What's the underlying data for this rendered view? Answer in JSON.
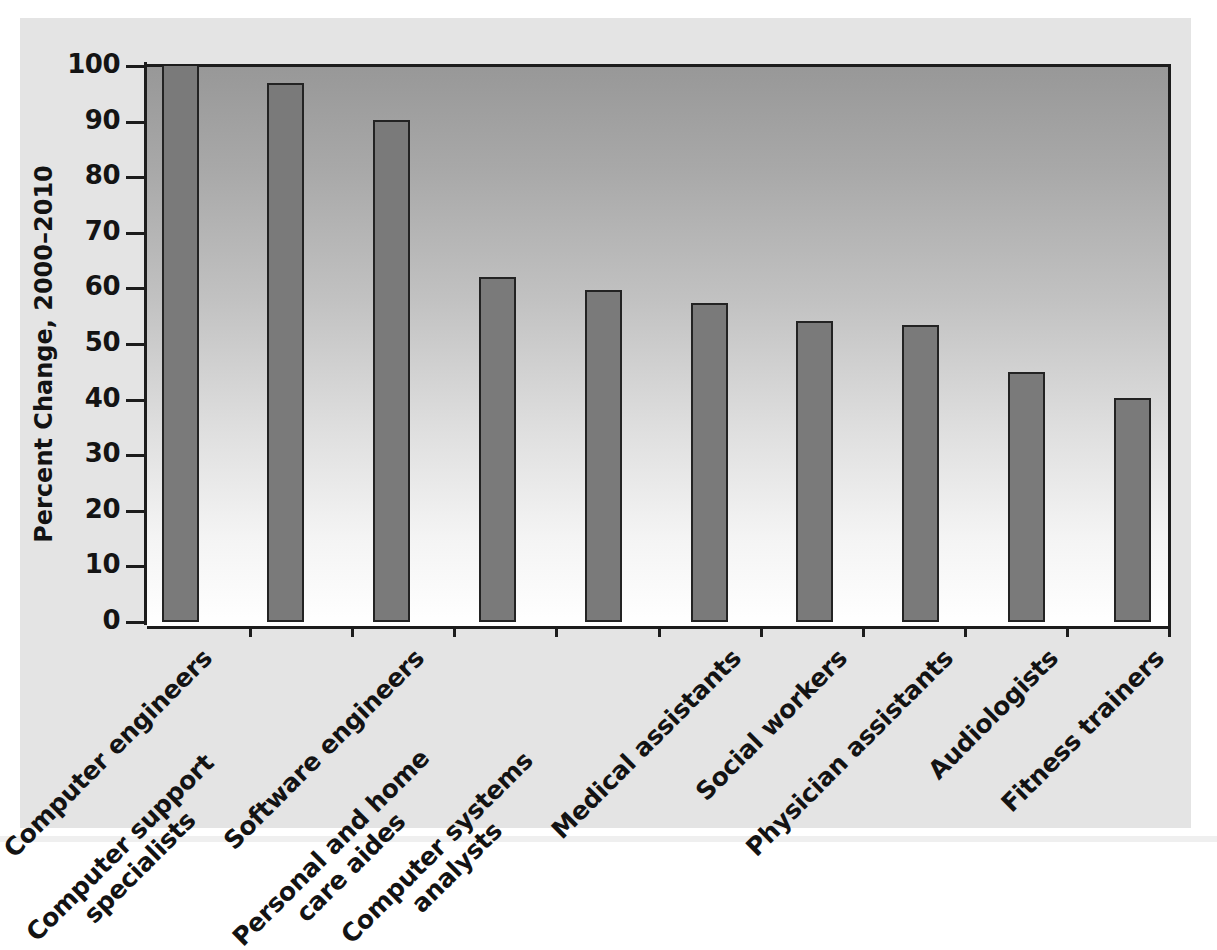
{
  "chart_data": {
    "type": "bar",
    "title": "",
    "subtitle": "",
    "xlabel": "",
    "ylabel": "Percent Change, 2000–2010",
    "ylim": [
      0,
      100
    ],
    "yticks": [
      0,
      10,
      20,
      30,
      40,
      50,
      60,
      70,
      80,
      90,
      100
    ],
    "ytick_labels": [
      "0",
      "10",
      "20",
      "30",
      "40",
      "50",
      "60",
      "70",
      "80",
      "90",
      "100"
    ],
    "grid": false,
    "legend": false,
    "bar_color": "#7a7a7a",
    "bar_edge_color": "#232323",
    "axis_color": "#1c1c1c",
    "panel_color": "#e4e4e4",
    "plot_gradient_top": "#989898",
    "plot_gradient_bottom": "#ffffff",
    "note": "First bar is clipped at the top of the axis (value exceeds the 100 axis maximum).",
    "categories": [
      "Computer engineers",
      "Computer support specialists",
      "Software engineers",
      "Personal and home care aides",
      "Computer systems analysts",
      "Medical assistants",
      "Social workers",
      "Physician assistants",
      "Audiologists",
      "Fitness trainers"
    ],
    "category_lines": [
      [
        "Computer engineers"
      ],
      [
        "Computer support",
        "specialists"
      ],
      [
        "Software engineers"
      ],
      [
        "Personal and home",
        "care aides"
      ],
      [
        "Computer systems",
        "analysts"
      ],
      [
        "Medical assistants"
      ],
      [
        "Social workers"
      ],
      [
        "Physician assistants"
      ],
      [
        "Audiologists"
      ],
      [
        "Fitness trainers"
      ]
    ],
    "values": [
      100,
      97,
      90.3,
      62,
      59.7,
      57.3,
      54.2,
      53.4,
      45,
      40.3
    ],
    "values_clipped": [
      true,
      false,
      false,
      false,
      false,
      false,
      false,
      false,
      false,
      false
    ]
  }
}
